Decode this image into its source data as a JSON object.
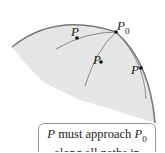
{
  "diagram": {
    "labels": {
      "p0": "P",
      "p0_sub": "0",
      "p_left": "P",
      "p_middle": "P",
      "p_right": "P"
    },
    "caption": {
      "line1_var": "P",
      "line1_text": " must approach ",
      "line1_var2": "P",
      "line1_sub": "0",
      "line2": "along all paths in"
    },
    "colors": {
      "region_fill": "#e6e6e6",
      "boundary": "#777777",
      "path": "#8a8a8a",
      "point": "#111111"
    }
  }
}
